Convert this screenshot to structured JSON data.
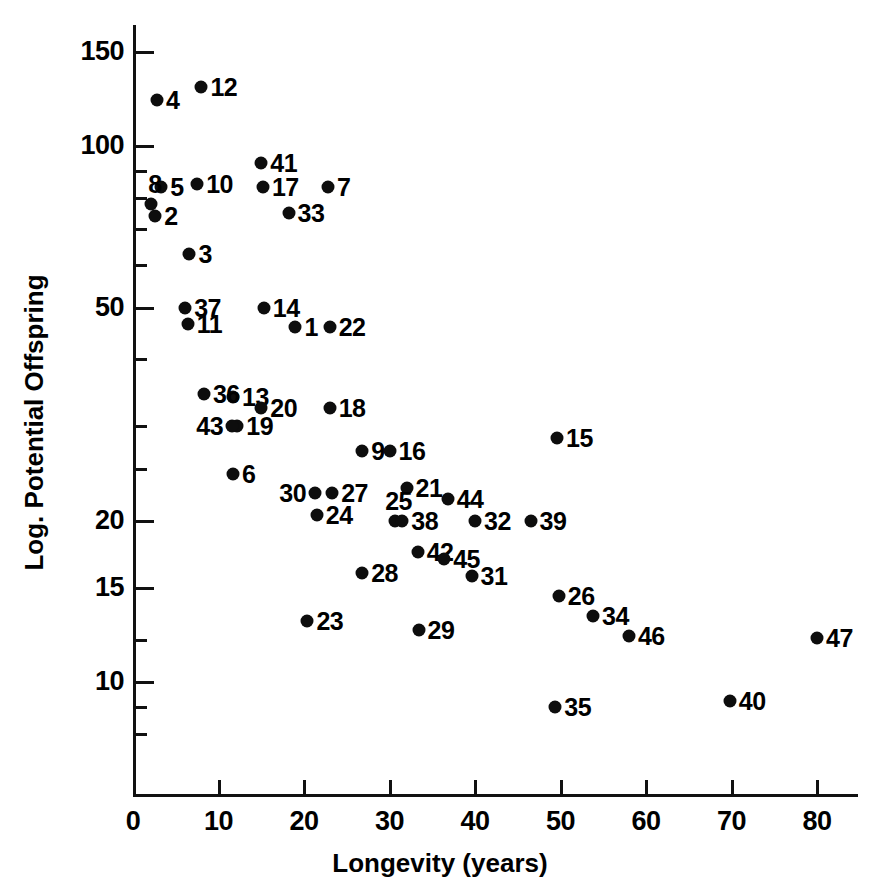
{
  "chart_data": {
    "type": "scatter",
    "title": "",
    "xlabel": "Longevity (years)",
    "ylabel": "Log. Potential Offspring",
    "xlim": [
      0,
      85
    ],
    "ylim_log": [
      7.6,
      170
    ],
    "yscale": "log",
    "xscale": "linear",
    "grid": false,
    "legend": "none",
    "x_ticks": [
      0,
      10,
      20,
      30,
      40,
      50,
      60,
      70,
      80
    ],
    "x_tick_labels": [
      "0",
      "10",
      "20",
      "30",
      "40",
      "50",
      "60",
      "70",
      "80"
    ],
    "y_ticks_major": [
      150,
      100,
      50,
      20,
      15,
      10
    ],
    "y_tick_labels": [
      "150",
      "100",
      "50",
      "20",
      "15",
      "10"
    ],
    "y_ticks_minor": [
      90,
      80,
      70,
      60,
      40,
      30,
      25,
      12,
      9,
      8
    ],
    "point_label_note": "Each point is annotated with a species index number",
    "points": [
      {
        "label": "1",
        "x": 19.0,
        "y": 46.0,
        "lpos": "right"
      },
      {
        "label": "2",
        "x": 2.6,
        "y": 74.0,
        "lpos": "right"
      },
      {
        "label": "3",
        "x": 6.6,
        "y": 63.0,
        "lpos": "right"
      },
      {
        "label": "4",
        "x": 2.8,
        "y": 122.0,
        "lpos": "right"
      },
      {
        "label": "5",
        "x": 3.3,
        "y": 84.0,
        "lpos": "right"
      },
      {
        "label": "6",
        "x": 11.7,
        "y": 24.5,
        "lpos": "right"
      },
      {
        "label": "7",
        "x": 22.8,
        "y": 84.0,
        "lpos": "right"
      },
      {
        "label": "8",
        "x": 2.1,
        "y": 78.0,
        "lpos": "above"
      },
      {
        "label": "9",
        "x": 26.8,
        "y": 27.0,
        "lpos": "right"
      },
      {
        "label": "10",
        "x": 7.5,
        "y": 85.0,
        "lpos": "right"
      },
      {
        "label": "11",
        "x": 6.4,
        "y": 46.5,
        "lpos": "right"
      },
      {
        "label": "12",
        "x": 8.0,
        "y": 129.0,
        "lpos": "right"
      },
      {
        "label": "13",
        "x": 11.7,
        "y": 34.0,
        "lpos": "right"
      },
      {
        "label": "14",
        "x": 15.3,
        "y": 50.0,
        "lpos": "right"
      },
      {
        "label": "15",
        "x": 49.6,
        "y": 28.5,
        "lpos": "right"
      },
      {
        "label": "16",
        "x": 30.0,
        "y": 27.0,
        "lpos": "right"
      },
      {
        "label": "17",
        "x": 15.2,
        "y": 84.0,
        "lpos": "right"
      },
      {
        "label": "18",
        "x": 23.0,
        "y": 32.5,
        "lpos": "right"
      },
      {
        "label": "19",
        "x": 12.2,
        "y": 30.0,
        "lpos": "right"
      },
      {
        "label": "20",
        "x": 15.0,
        "y": 32.5,
        "lpos": "right"
      },
      {
        "label": "21",
        "x": 32.0,
        "y": 23.0,
        "lpos": "right"
      },
      {
        "label": "22",
        "x": 23.0,
        "y": 46.0,
        "lpos": "right"
      },
      {
        "label": "23",
        "x": 20.4,
        "y": 13.0,
        "lpos": "right"
      },
      {
        "label": "24",
        "x": 21.5,
        "y": 20.5,
        "lpos": "right"
      },
      {
        "label": "25",
        "x": 30.6,
        "y": 20.0,
        "lpos": "above"
      },
      {
        "label": "26",
        "x": 49.8,
        "y": 14.5,
        "lpos": "right"
      },
      {
        "label": "27",
        "x": 23.3,
        "y": 22.5,
        "lpos": "right"
      },
      {
        "label": "28",
        "x": 26.8,
        "y": 16.0,
        "lpos": "right"
      },
      {
        "label": "29",
        "x": 33.4,
        "y": 12.5,
        "lpos": "right"
      },
      {
        "label": "30",
        "x": 21.3,
        "y": 22.5,
        "lpos": "left"
      },
      {
        "label": "31",
        "x": 39.6,
        "y": 15.8,
        "lpos": "right"
      },
      {
        "label": "32",
        "x": 40.0,
        "y": 20.0,
        "lpos": "right"
      },
      {
        "label": "33",
        "x": 18.2,
        "y": 75.0,
        "lpos": "right"
      },
      {
        "label": "34",
        "x": 53.8,
        "y": 13.3,
        "lpos": "right"
      },
      {
        "label": "35",
        "x": 49.4,
        "y": 9.0,
        "lpos": "right"
      },
      {
        "label": "36",
        "x": 8.3,
        "y": 34.5,
        "lpos": "right"
      },
      {
        "label": "37",
        "x": 6.1,
        "y": 50.0,
        "lpos": "right"
      },
      {
        "label": "38",
        "x": 31.5,
        "y": 20.0,
        "lpos": "right"
      },
      {
        "label": "39",
        "x": 46.5,
        "y": 20.0,
        "lpos": "right"
      },
      {
        "label": "40",
        "x": 69.8,
        "y": 9.2,
        "lpos": "right"
      },
      {
        "label": "41",
        "x": 15.0,
        "y": 93.0,
        "lpos": "right"
      },
      {
        "label": "42",
        "x": 33.3,
        "y": 17.5,
        "lpos": "right"
      },
      {
        "label": "43",
        "x": 11.6,
        "y": 30.0,
        "lpos": "left"
      },
      {
        "label": "44",
        "x": 36.8,
        "y": 22.0,
        "lpos": "right"
      },
      {
        "label": "45",
        "x": 36.4,
        "y": 17.0,
        "lpos": "right"
      },
      {
        "label": "46",
        "x": 58.0,
        "y": 12.2,
        "lpos": "right"
      },
      {
        "label": "47",
        "x": 80.0,
        "y": 12.1,
        "lpos": "right"
      }
    ]
  },
  "colors": {
    "ink": "#0d0d0d",
    "background": "#ffffff"
  }
}
